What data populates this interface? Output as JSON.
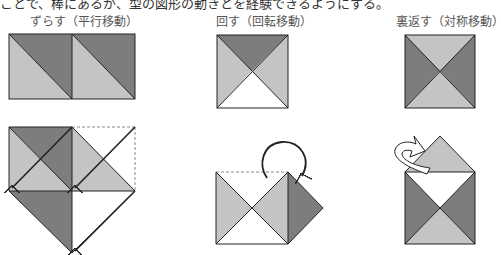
{
  "intro_text": "ことで、棒にあるが、型の図形の動きとを経験できるようにする。",
  "columns": [
    {
      "id": "translate",
      "heading": "ずらす（平行移動）"
    },
    {
      "id": "rotate",
      "heading": "回す（回転移動）"
    },
    {
      "id": "reflect",
      "heading": "裏返す（対称移動）"
    }
  ],
  "colors": {
    "dark": "#7d7d7d",
    "light": "#c4c4c4",
    "white": "#ffffff",
    "stroke": "#222222",
    "dashed": "#888888"
  }
}
